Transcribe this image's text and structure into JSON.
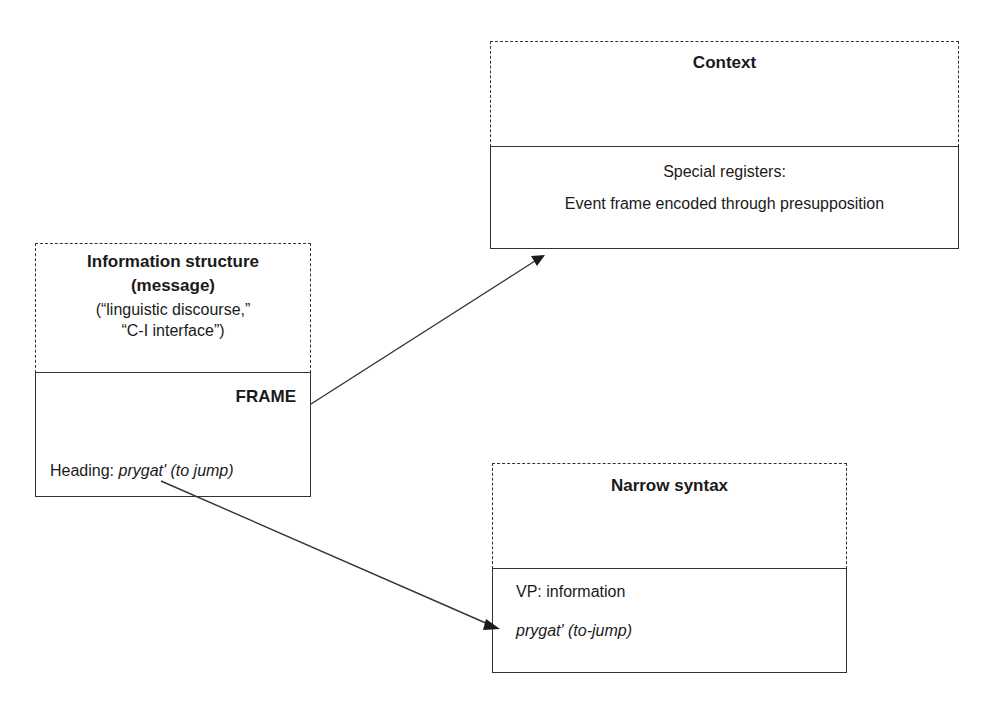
{
  "diagram": {
    "info_box": {
      "title_line1": "Information structure",
      "title_line2": "(message)",
      "sub_line1": "(“linguistic discourse,”",
      "sub_line2": "“C-I interface”)",
      "frame_label": "FRAME",
      "heading_label": "Heading: ",
      "heading_value": "prygat' (to jump)"
    },
    "context_box": {
      "title": "Context",
      "line1": "Special registers:",
      "line2": "Event frame encoded through presupposition"
    },
    "syntax_box": {
      "title": "Narrow syntax",
      "line1": "VP: information",
      "line2": "prygat' (to-jump)"
    },
    "arrows": [
      {
        "from": "info_box.frame",
        "to": "context_box"
      },
      {
        "from": "info_box.heading",
        "to": "syntax_box.prygat"
      }
    ],
    "colors": {
      "line": "#333333",
      "text": "#1a1a1a",
      "background": "#ffffff"
    }
  }
}
